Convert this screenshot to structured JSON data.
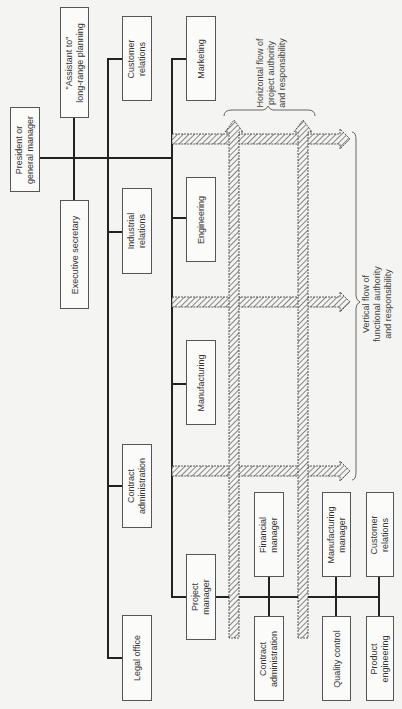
{
  "diagram": {
    "top": {
      "president": "President or\ngeneral manager",
      "assistant": "\"Assistant to\"\nlong-range planning",
      "exec_secretary": "Executive secretary"
    },
    "staff": {
      "customer_relations": "Customer\nrelations",
      "industrial_relations": "Industrial\nrelations",
      "contract_administration": "Contract\nadministration",
      "legal_office": "Legal office"
    },
    "functional": {
      "marketing": "Marketing",
      "engineering": "Engineering",
      "manufacturing": "Manufacturing",
      "project_manager": "Project\nmanager"
    },
    "project_team": {
      "financial_manager": "Financial\nmanager",
      "manufacturing_manager": "Manufacturing\nmanager",
      "customer_relations": "Customer\nrelations",
      "contract_administration": "Contract\nadministration",
      "quality_control": "Quality control",
      "product_engineering": "Product\nengineering"
    },
    "annotations": {
      "horizontal_flow": "Horizontal flow of\nproject authority\nand responsibility",
      "vertical_flow": "Vertical flow of\nfunctional authority\nand responsibility"
    }
  }
}
